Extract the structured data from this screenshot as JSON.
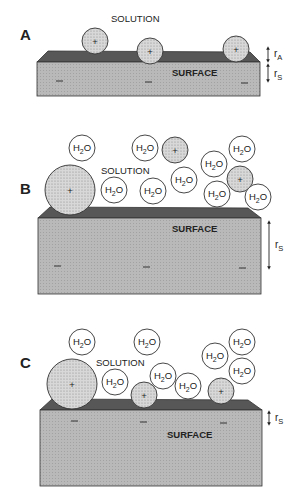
{
  "colors": {
    "slab_top": "#585858",
    "slab_front": "#b4b4b4",
    "ion_fill": "#cfcfcf",
    "outline": "#333333",
    "water_fill": "#ffffff"
  },
  "labels": {
    "solution": "SOLUTION",
    "surface": "SURFACE",
    "water": "H",
    "water_sub": "2",
    "water_o": "O",
    "ion_sign": "+",
    "surface_charge": "—",
    "r": "r",
    "r_adsorbate_sub": "A",
    "r_surface_sub": "S"
  },
  "panels": [
    {
      "id": "A",
      "label": "A",
      "description": "Bare cations adsorbed directly on negatively charged surface; separation r_A + r_S"
    },
    {
      "id": "B",
      "label": "B",
      "description": "Hydrated cations in solution; separation r_S large"
    },
    {
      "id": "C",
      "label": "C",
      "description": "Cations partially dehydrated at surface; small r_S"
    }
  ]
}
